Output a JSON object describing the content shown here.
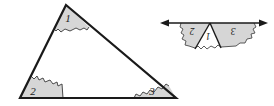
{
  "figure": {
    "background_color": "#ffffff",
    "stroke_color": "#1a1a1a",
    "arc_fill_color": "#d4d4d4",
    "arc_stroke_color": "#555555"
  },
  "left_figure": {
    "name": "triangle-with-three-marked-angles",
    "shape": "triangle",
    "vertices": {
      "apex": {
        "x": 66,
        "y": 5
      },
      "bottom_left": {
        "x": 20,
        "y": 98
      },
      "bottom_right": {
        "x": 176,
        "y": 98
      }
    },
    "angles": [
      {
        "id": "angle-1",
        "label": "1",
        "vertex": "apex",
        "label_x": 68,
        "label_y": 22,
        "rotated": false
      },
      {
        "id": "angle-2",
        "label": "2",
        "vertex": "bottom_left",
        "label_x": 33,
        "label_y": 94,
        "rotated": false
      },
      {
        "id": "angle-3",
        "label": "3",
        "vertex": "bottom_right",
        "label_x": 152,
        "label_y": 94,
        "rotated": false
      }
    ]
  },
  "right_figure": {
    "name": "angles-arranged-on-straight-line",
    "line": {
      "y": 23,
      "x_start": 160,
      "x_end": 268,
      "arrowheads": [
        "left",
        "right"
      ]
    },
    "apex": {
      "x": 210,
      "y": 23
    },
    "angles": [
      {
        "id": "angle-2-copy",
        "label": "2",
        "label_x": 192,
        "label_y": 36,
        "rotated": true
      },
      {
        "id": "angle-1-copy",
        "label": "1",
        "label_x": 207,
        "label_y": 40,
        "rotated": true
      },
      {
        "id": "angle-3-copy",
        "label": "3",
        "label_x": 231,
        "label_y": 35,
        "rotated": true
      }
    ]
  }
}
